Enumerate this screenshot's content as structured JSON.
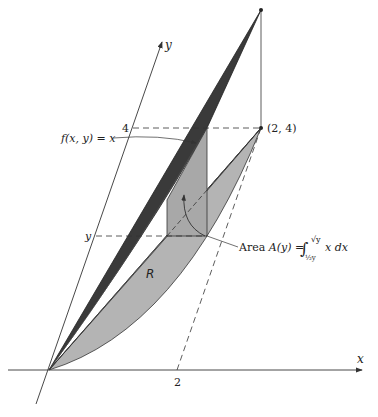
{
  "figure": {
    "axes": {
      "x_label": "x",
      "y_label": "y",
      "x_tick": "2",
      "y_tick_top": "4",
      "y_tick_var": "y"
    },
    "labels": {
      "surface": "f(x, y) = x",
      "point": "(2, 4)",
      "region": "R",
      "area_prefix": "Area ",
      "area_func": "A(y)",
      "area_eq": " = ",
      "integral_sign": "∫",
      "upper_limit": "√y",
      "lower_limit": "½y",
      "integrand": "x dx"
    },
    "colors": {
      "dark_surface": "#3a3a3a",
      "region_fill": "#b4b4b4",
      "cross_section_fill": "#a8a8a8",
      "line": "#333333"
    }
  }
}
